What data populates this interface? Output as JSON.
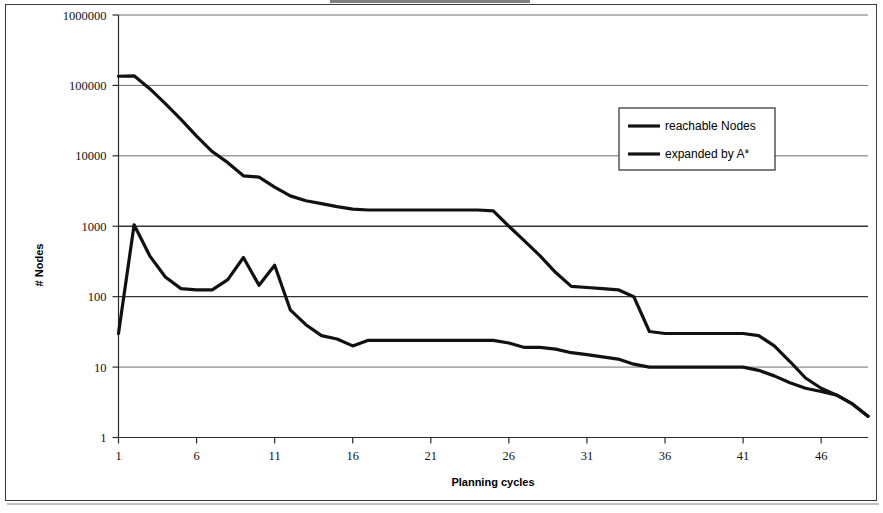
{
  "chart_data": {
    "type": "line",
    "title": "",
    "xlabel": "Planning cycles",
    "ylabel": "# Nodes",
    "yscale": "log",
    "ylim": [
      1,
      1000000
    ],
    "xlim": [
      1,
      49
    ],
    "grid": true,
    "legend_position": "top-right-inside",
    "y_ticks": [
      "1",
      "10",
      "100",
      "1000",
      "10000",
      "100000",
      "1000000"
    ],
    "y_tick_values": [
      1,
      10,
      100,
      1000,
      10000,
      100000,
      1000000
    ],
    "x_ticks": [
      "1",
      "6",
      "11",
      "16",
      "21",
      "26",
      "31",
      "36",
      "41",
      "46"
    ],
    "x_tick_values": [
      1,
      6,
      11,
      16,
      21,
      26,
      31,
      36,
      41,
      46
    ],
    "x": [
      1,
      2,
      3,
      4,
      5,
      6,
      7,
      8,
      9,
      10,
      11,
      12,
      13,
      14,
      15,
      16,
      17,
      18,
      19,
      20,
      21,
      22,
      23,
      24,
      25,
      26,
      27,
      28,
      29,
      30,
      31,
      32,
      33,
      34,
      35,
      36,
      37,
      38,
      39,
      40,
      41,
      42,
      43,
      44,
      45,
      46,
      47,
      48,
      49
    ],
    "series": [
      {
        "name": "reachable Nodes",
        "values": [
          135000,
          137000,
          90000,
          55000,
          33000,
          19000,
          11500,
          8000,
          5200,
          5000,
          3600,
          2700,
          2300,
          2100,
          1900,
          1750,
          1700,
          1700,
          1700,
          1700,
          1700,
          1700,
          1700,
          1700,
          1650,
          1000,
          620,
          380,
          220,
          140,
          135,
          130,
          125,
          100,
          32,
          30,
          30,
          30,
          30,
          30,
          30,
          28,
          20,
          12,
          7,
          5,
          4,
          3,
          2
        ]
      },
      {
        "name": "expanded by A*",
        "values": [
          30,
          1050,
          380,
          190,
          130,
          125,
          125,
          175,
          360,
          145,
          280,
          65,
          40,
          28,
          25,
          20,
          24,
          24,
          24,
          24,
          24,
          24,
          24,
          24,
          24,
          22,
          19,
          19,
          18,
          16,
          15,
          14,
          13,
          11,
          10,
          10,
          10,
          10,
          10,
          10,
          10,
          9,
          7.5,
          6,
          5,
          4.5,
          4,
          3,
          2
        ]
      }
    ]
  },
  "legend": {
    "entries": [
      {
        "label": "reachable Nodes"
      },
      {
        "label": "expanded by A*"
      }
    ]
  },
  "axes": {
    "x_title": "Planning cycles",
    "y_title": "# Nodes"
  }
}
